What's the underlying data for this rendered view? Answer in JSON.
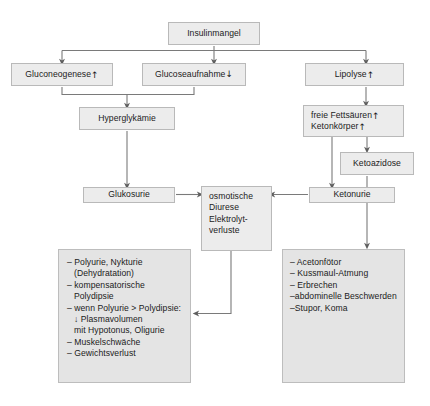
{
  "diagram": {
    "title_node": {
      "label": "Insulinmangel"
    },
    "nodes": {
      "gluconeogenese": {
        "label": "Gluconeogenese",
        "arrow": "↑"
      },
      "glucoseaufnahme": {
        "label": "Glucoseaufnahme",
        "arrow": "↓"
      },
      "lipolyse": {
        "label": "Lipolyse",
        "arrow": "↑"
      },
      "hyperglykaemie": {
        "label": "Hyperglykämie"
      },
      "freie_fettsaeuren": {
        "line1": "freie Fettsäuren",
        "arrow1": "↑",
        "line2": "Ketonkörper",
        "arrow2": "↑"
      },
      "ketoazidose": {
        "label": "Ketoazidose"
      },
      "glukosurie": {
        "label": "Glukosurie"
      },
      "ketonurie": {
        "label": "Ketonurie"
      },
      "osmotische_diurese": {
        "line1": "osmotische",
        "line2": "Diurese",
        "line3": "Elektrolyt-",
        "line4": "verluste"
      }
    },
    "left_symptom_box": {
      "items": [
        {
          "text": "– Polyurie, Nykturie",
          "indent": false
        },
        {
          "text": "(Dehydratation)",
          "indent": true
        },
        {
          "text": "– kompensatorische",
          "indent": false
        },
        {
          "text": "Polydipsie",
          "indent": true
        },
        {
          "text": "– wenn Polyurie > Polydipsie:",
          "indent": false
        },
        {
          "text": "↓ Plasmavolumen",
          "indent": true
        },
        {
          "text": "mit Hypotonus, Oligurie",
          "indent": true
        },
        {
          "text": "– Muskelschwäche",
          "indent": false
        },
        {
          "text": "– Gewichtsverlust",
          "indent": false
        }
      ]
    },
    "right_symptom_box": {
      "items": [
        {
          "text": "– Acetonfötor",
          "indent": false
        },
        {
          "text": "– Kussmaul-Atmung",
          "indent": false
        },
        {
          "text": "– Erbrechen",
          "indent": false
        },
        {
          "text": "–abdominelle Beschwerden",
          "indent": false
        },
        {
          "text": "–Stupor, Koma",
          "indent": false
        }
      ]
    },
    "colors": {
      "node_fill": "#ececec",
      "node_border": "#b9b9b9",
      "list_fill": "#e4e4e4",
      "edge": "#6b6b6b",
      "text": "#1b1b1b",
      "background": "#ffffff"
    }
  }
}
